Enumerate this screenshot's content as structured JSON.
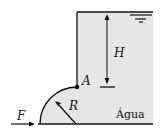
{
  "diagram": {
    "type": "fluid-mechanics-gate",
    "labels": {
      "depth": "H",
      "hinge": "A",
      "radius": "R",
      "force": "F",
      "fluid": "Água"
    },
    "colors": {
      "water": "#e6e6e6",
      "line": "#111111",
      "background": "#ffffff"
    }
  }
}
